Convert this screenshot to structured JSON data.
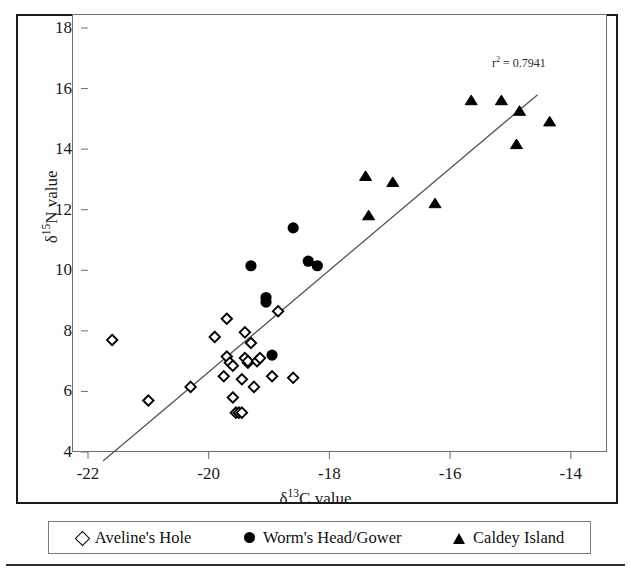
{
  "figure": {
    "background_color": "#ffffff",
    "frame_color": "#1a1a1a",
    "plot_box_color": "#6e6e6e"
  },
  "annotations": {
    "r_squared_prefix": "r",
    "r_squared_exponent": "2",
    "r_squared_value": " = 0.7941",
    "r_squared_text": "r2 = 0.7941"
  },
  "axes": {
    "y": {
      "title_prefix": "δ",
      "title_exponent": "15",
      "title_suffix": "N value",
      "ticks": [
        "4",
        "6",
        "8",
        "10",
        "12",
        "14",
        "16",
        "18"
      ],
      "min": 4,
      "max": 18,
      "step": 2
    },
    "x": {
      "title_prefix": "δ",
      "title_exponent": "13",
      "title_suffix": "C value",
      "ticks": [
        "-22",
        "-20",
        "-18",
        "-16",
        "-14"
      ],
      "min": -22,
      "max": -13.4,
      "step": 2
    }
  },
  "legend": {
    "items": [
      {
        "label": "Aveline's Hole",
        "marker": "diamond-open",
        "color": "#000000"
      },
      {
        "label": "Worm's Head/Gower",
        "marker": "circle-filled",
        "color": "#000000"
      },
      {
        "label": "Caldey Island",
        "marker": "triangle-filled",
        "color": "#000000"
      }
    ]
  },
  "chart_data": {
    "type": "scatter",
    "title": "",
    "xlabel": "δ13C value",
    "ylabel": "δ15N value",
    "xlim": [
      -22,
      -13.4
    ],
    "ylim": [
      4,
      18
    ],
    "grid": false,
    "legend_position": "bottom",
    "annotation": "r² = 0.7941",
    "series": [
      {
        "name": "Aveline's Hole",
        "marker": "diamond-open",
        "points": [
          [
            -21.6,
            7.7
          ],
          [
            -21.0,
            5.7
          ],
          [
            -20.3,
            6.15
          ],
          [
            -19.9,
            7.8
          ],
          [
            -19.75,
            6.5
          ],
          [
            -19.7,
            8.4
          ],
          [
            -19.7,
            7.15
          ],
          [
            -19.65,
            6.95
          ],
          [
            -19.6,
            6.85
          ],
          [
            -19.6,
            5.8
          ],
          [
            -19.55,
            5.3
          ],
          [
            -19.5,
            5.3
          ],
          [
            -19.45,
            6.4
          ],
          [
            -19.45,
            5.3
          ],
          [
            -19.4,
            7.95
          ],
          [
            -19.4,
            7.1
          ],
          [
            -19.35,
            6.95
          ],
          [
            -19.35,
            7.0
          ],
          [
            -19.3,
            7.6
          ],
          [
            -19.25,
            6.15
          ],
          [
            -19.2,
            7.0
          ],
          [
            -19.15,
            7.1
          ],
          [
            -18.95,
            6.5
          ],
          [
            -18.85,
            8.65
          ],
          [
            -18.6,
            6.45
          ]
        ]
      },
      {
        "name": "Worm's Head/Gower",
        "marker": "circle-filled",
        "points": [
          [
            -19.3,
            10.15
          ],
          [
            -19.05,
            9.1
          ],
          [
            -19.05,
            8.95
          ],
          [
            -18.95,
            7.2
          ],
          [
            -18.6,
            11.4
          ],
          [
            -18.35,
            10.3
          ],
          [
            -18.2,
            10.15
          ]
        ]
      },
      {
        "name": "Caldey Island",
        "marker": "triangle-filled",
        "points": [
          [
            -17.4,
            13.1
          ],
          [
            -17.35,
            11.8
          ],
          [
            -16.95,
            12.9
          ],
          [
            -16.25,
            12.2
          ],
          [
            -15.65,
            15.6
          ],
          [
            -15.15,
            15.6
          ],
          [
            -14.85,
            15.25
          ],
          [
            -14.9,
            14.15
          ],
          [
            -14.35,
            14.9
          ]
        ]
      }
    ],
    "regression_line": {
      "x_start": -21.75,
      "y_start": 3.7,
      "x_end": -14.55,
      "y_end": 15.8,
      "r_squared": 0.7941
    }
  }
}
